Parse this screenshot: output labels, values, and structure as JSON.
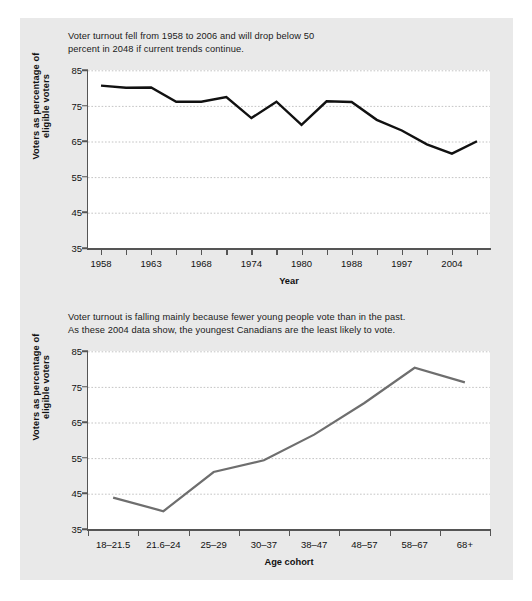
{
  "figure": {
    "background_color": "#e9e9e9",
    "plot_background_color": "#ffffff"
  },
  "charts": [
    {
      "id": "voter-turnout-by-year",
      "caption_line1": "Voter turnout fell from 1958 to 2006 and will drop below 50",
      "caption_line2": "percent in 2048 if current trends continue.",
      "ylabel": "Voters as percentage of eligible voters",
      "xlabel": "Year",
      "yticks": [
        "85",
        "75",
        "65",
        "55",
        "45",
        "35"
      ],
      "xticks": [
        "1958",
        "1963",
        "1968",
        "1974",
        "1980",
        "1988",
        "1997",
        "2004"
      ],
      "line_color": "#111111"
    },
    {
      "id": "voter-turnout-by-age-cohort",
      "caption_line1": "Voter turnout is falling mainly because fewer young people vote than in the past.",
      "caption_line2": "As these 2004 data show, the youngest Canadians are the least likely to vote.",
      "ylabel": "Voters as percentage of eligible voters",
      "xlabel": "Age cohort",
      "yticks": [
        "85",
        "75",
        "65",
        "55",
        "45",
        "35"
      ],
      "xticks": [
        "18–21.5",
        "21.6–24",
        "25–29",
        "30–37",
        "38–47",
        "48–57",
        "58–67",
        "68+"
      ],
      "line_color": "#6e6e6e"
    }
  ],
  "chart_data": [
    {
      "type": "line",
      "title": "Voter turnout fell from 1958 to 2006 and will drop below 50 percent in 2048 if current trends continue.",
      "xlabel": "Year",
      "ylabel": "Voters as percentage of eligible voters",
      "ylim": [
        35,
        85
      ],
      "yticks": [
        35,
        45,
        55,
        65,
        75,
        85
      ],
      "grid": true,
      "legend": "none",
      "x": [
        1958,
        1962,
        1963,
        1965,
        1968,
        1972,
        1974,
        1979,
        1980,
        1984,
        1988,
        1993,
        1997,
        2000,
        2004,
        2006
      ],
      "tick_labels": [
        "1958",
        "1963",
        "1968",
        "1974",
        "1980",
        "1988",
        "1997",
        "2004"
      ],
      "values": [
        80.6,
        80.0,
        80.1,
        76.1,
        76.1,
        77.4,
        71.5,
        76.1,
        69.6,
        76.2,
        76.0,
        71.0,
        68.0,
        64.1,
        61.5,
        65.0
      ],
      "series": [
        {
          "name": "Voter turnout",
          "values": [
            80.6,
            80.0,
            80.1,
            76.1,
            76.1,
            77.4,
            71.5,
            76.1,
            69.6,
            76.2,
            76.0,
            71.0,
            68.0,
            64.1,
            61.5,
            65.0
          ]
        }
      ]
    },
    {
      "type": "line",
      "title": "Voter turnout is falling mainly because fewer young people vote than in the past. As these 2004 data show, the youngest Canadians are the least likely to vote.",
      "xlabel": "Age cohort",
      "ylabel": "Voters as percentage of eligible voters",
      "ylim": [
        35,
        85
      ],
      "yticks": [
        35,
        45,
        55,
        65,
        75,
        85
      ],
      "grid": true,
      "legend": "none",
      "categories": [
        "18–21.5",
        "21.6–24",
        "25–29",
        "30–37",
        "38–47",
        "48–57",
        "58–67",
        "68+"
      ],
      "values": [
        43.8,
        40.0,
        51.0,
        54.3,
        61.5,
        70.4,
        80.3,
        76.2
      ],
      "series": [
        {
          "name": "2004 turnout by age cohort",
          "values": [
            43.8,
            40.0,
            51.0,
            54.3,
            61.5,
            70.4,
            80.3,
            76.2
          ]
        }
      ]
    }
  ]
}
